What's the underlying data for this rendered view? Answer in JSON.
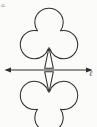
{
  "figure": {
    "corner_label": "a.",
    "axis_label": "ℓ",
    "stroke_color": "#2e2e2e",
    "background_color": "#fbfbfa",
    "axis_color": "#2e2e2e",
    "caption_color": "#9a9a98"
  },
  "diagram_data": {
    "type": "reflection-diagram",
    "description": "A club (clover) shape above a horizontal line and its mirror reflection below the line",
    "elements": [
      {
        "name": "club-shape-upper",
        "position": "above-axis",
        "lobes": 3,
        "stem": "triangle",
        "center_x": 49,
        "top_y": 8,
        "bottom_y": 68
      },
      {
        "name": "axis-line",
        "orientation": "horizontal",
        "y": 70,
        "x_start": 6,
        "x_end": 91,
        "arrowheads": "both",
        "label": "ℓ"
      },
      {
        "name": "club-shape-lower",
        "position": "below-axis",
        "lobes": 3,
        "stem": "triangle",
        "center_x": 49,
        "top_y": 72,
        "bottom_y": 132,
        "note": "mirror image of upper shape, clipped at image bottom edge"
      }
    ],
    "symmetry": "reflection across horizontal line",
    "axis_range_x": [
      6,
      91
    ],
    "grid": false,
    "legend": false
  }
}
